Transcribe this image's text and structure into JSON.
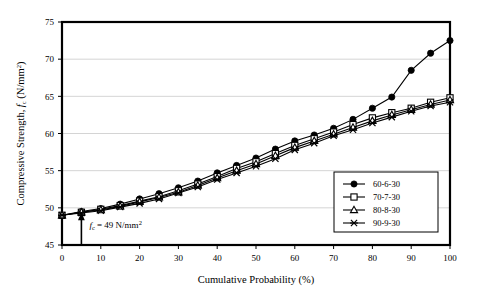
{
  "chart_data": {
    "type": "line",
    "title": "",
    "xlabel": "Cumulative Probability (%)",
    "ylabel": "Compressive Strength, f c (N/mm2)",
    "ylabel_parts": {
      "main": "Compressive Strength, ",
      "italic": "f",
      "subscript": "c",
      "units_open": " (N/mm",
      "superscript": "2",
      "units_close": ")"
    },
    "xlim": [
      0,
      100
    ],
    "ylim": [
      45,
      75
    ],
    "xticks": [
      0,
      10,
      20,
      30,
      40,
      50,
      60,
      70,
      80,
      90,
      100
    ],
    "yticks": [
      45,
      50,
      55,
      60,
      65,
      70,
      75
    ],
    "grid": "horizontal",
    "legend_position": "lower-right",
    "x": [
      0,
      5,
      10,
      15,
      20,
      25,
      30,
      35,
      40,
      45,
      50,
      55,
      60,
      65,
      70,
      75,
      80,
      85,
      90,
      95,
      100
    ],
    "series": [
      {
        "name": "60-6-30",
        "marker": "filled-circle",
        "values": [
          49.0,
          49.5,
          49.9,
          50.5,
          51.2,
          51.9,
          52.7,
          53.6,
          54.7,
          55.7,
          56.7,
          57.9,
          59.0,
          59.8,
          60.7,
          61.9,
          63.4,
          64.9,
          68.5,
          70.8,
          72.5
        ]
      },
      {
        "name": "70-7-30",
        "marker": "open-square",
        "values": [
          49.0,
          49.4,
          49.8,
          50.3,
          50.9,
          51.5,
          52.3,
          53.2,
          54.2,
          55.3,
          56.2,
          57.3,
          58.4,
          59.3,
          60.2,
          61.2,
          62.1,
          62.8,
          63.4,
          64.2,
          64.8
        ]
      },
      {
        "name": "80-8-30",
        "marker": "open-triangle",
        "values": [
          49.0,
          49.4,
          49.7,
          50.2,
          50.8,
          51.4,
          52.1,
          53.0,
          54.0,
          55.0,
          55.9,
          57.0,
          58.1,
          59.0,
          59.9,
          60.8,
          61.7,
          62.5,
          63.2,
          63.9,
          64.5
        ]
      },
      {
        "name": "90-9-30",
        "marker": "cross-star",
        "values": [
          49.0,
          49.3,
          49.6,
          50.1,
          50.6,
          51.2,
          52.0,
          52.8,
          53.8,
          54.7,
          55.6,
          56.6,
          57.8,
          58.7,
          59.7,
          60.5,
          61.4,
          62.2,
          63.0,
          63.7,
          64.2
        ]
      }
    ],
    "annotation": {
      "text_italic": "f",
      "text_sub": "c",
      "text_main": " = 49 N/mm",
      "text_sup": "2",
      "x": 5,
      "y": 45,
      "arrow_to_y": 49.4
    },
    "colors": {
      "line": "#000000",
      "grid": "#c9c9c9",
      "axis": "#000000",
      "background": "#ffffff"
    }
  }
}
